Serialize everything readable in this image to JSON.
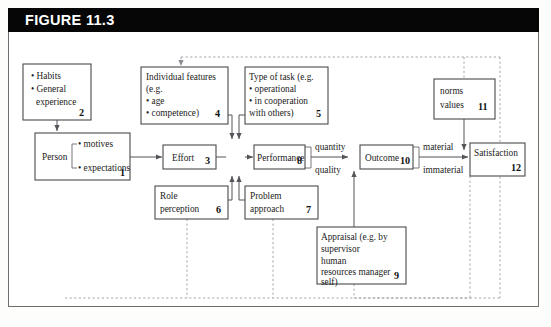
{
  "figure": {
    "title": "FIGURE 11.3",
    "header_background": "#060606",
    "header_text_color": "#ffffff",
    "frame_border_color": "#6e6e6e"
  },
  "diagram": {
    "type": "flow-diagram",
    "box_border_color": "#4a4a4a",
    "solid_line_color": "#55545a",
    "dashed_line_color": "#9c9ca2",
    "nodes": [
      {
        "id": "habits",
        "number": "2",
        "lines": [
          "• Habits",
          "• General",
          "   experience"
        ],
        "line1": "• Habits",
        "line2": "• General",
        "line3": "experience"
      },
      {
        "id": "person",
        "number": "1",
        "title": "Person",
        "bullet1": "• motives",
        "bullet2": "• expectations"
      },
      {
        "id": "individual-features",
        "number": "4",
        "line1": "Individual features",
        "line2": "(e.g.",
        "line3": "• age",
        "line4": "• competence)"
      },
      {
        "id": "type-of-task",
        "number": "5",
        "line1": "Type of task (e.g.",
        "line2": "• operational",
        "line3": "• in cooperation",
        "line4": "   with others)"
      },
      {
        "id": "effort",
        "number": "3",
        "title": "Effort"
      },
      {
        "id": "performance",
        "number": "8",
        "title": "Performance"
      },
      {
        "id": "role-perception",
        "number": "6",
        "line1": "Role",
        "line2": "perception"
      },
      {
        "id": "problem-approach",
        "number": "7",
        "line1": "Problem",
        "line2": "approach"
      },
      {
        "id": "outcome",
        "number": "10",
        "title": "Outcome"
      },
      {
        "id": "norms-values",
        "number": "11",
        "line1": "norms",
        "line2": "values"
      },
      {
        "id": "satisfaction",
        "number": "12",
        "title": "Satisfaction"
      },
      {
        "id": "appraisal",
        "number": "9",
        "line1": "Appraisal (e.g. by",
        "line2": "supervisor",
        "line3": "human",
        "line4": "resources manager",
        "line5": "self)"
      }
    ],
    "edge_labels": {
      "quantity": "quantity",
      "quality": "quality",
      "material": "material",
      "immaterial": "immaterial"
    }
  }
}
